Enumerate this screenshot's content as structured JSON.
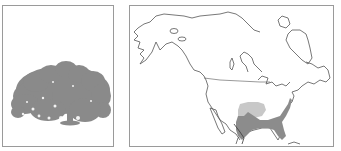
{
  "figure": {
    "left_panel": {
      "subject": "tree silhouette",
      "icon": "tree-silhouette-icon"
    },
    "right_panel": {
      "subject": "North America range map"
    }
  },
  "colors": {
    "border": "#9a9a9a",
    "tree": "#8a8a8a",
    "coastline": "#555555",
    "range_primary": "#8c8c8c",
    "range_secondary": "#c8c8c8",
    "range_edge": "#3a3a3a"
  },
  "legend": {
    "range_primary": "native range",
    "range_secondary": "secondary range"
  }
}
